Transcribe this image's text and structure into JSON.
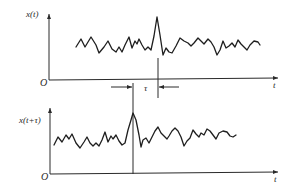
{
  "top_plot": {
    "ylabel": "x(t)",
    "xlabel": "t",
    "origin": "O"
  },
  "bottom_plot": {
    "ylabel": "x(t+τ)",
    "xlabel": "t",
    "origin": "O"
  },
  "shift_annotation": {
    "label": "τ"
  }
}
